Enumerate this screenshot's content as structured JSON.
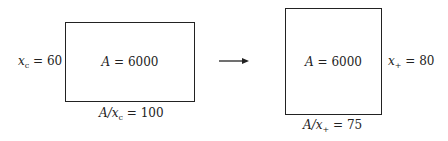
{
  "diagram": {
    "left": {
      "area_label": "A = 6000",
      "side_label": "x_c = 60",
      "bottom_label": "A/x_c = 100",
      "side_var": "x",
      "side_sub": "c",
      "side_val": " = 60",
      "bottom_pre": "A/",
      "bottom_var": "x",
      "bottom_sub": "c",
      "bottom_val": " = 100",
      "area_var": "A",
      "area_val": " = 6000"
    },
    "arrow": "right-arrow",
    "right": {
      "area_label": "A = 6000",
      "side_label": "x_+ = 80",
      "bottom_label": "A/x_+ = 75",
      "side_var": "x",
      "side_sub": "+",
      "side_val": " = 80",
      "bottom_pre": "A/",
      "bottom_var": "x",
      "bottom_sub": "+",
      "bottom_val": " = 75",
      "area_var": "A",
      "area_val": " = 6000"
    }
  }
}
